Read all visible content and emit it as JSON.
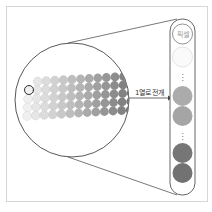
{
  "diagram": {
    "arrow_label": "1열로 전개",
    "first_cell_text": "픽셀",
    "ellipsis": "⋮",
    "colors": {
      "outline": "#555555",
      "light_gray": "#e8e8e8",
      "mid_gray": "#a8a8a8",
      "dark_gray": "#6e6e6e",
      "frame": "#d6d6d6"
    }
  }
}
